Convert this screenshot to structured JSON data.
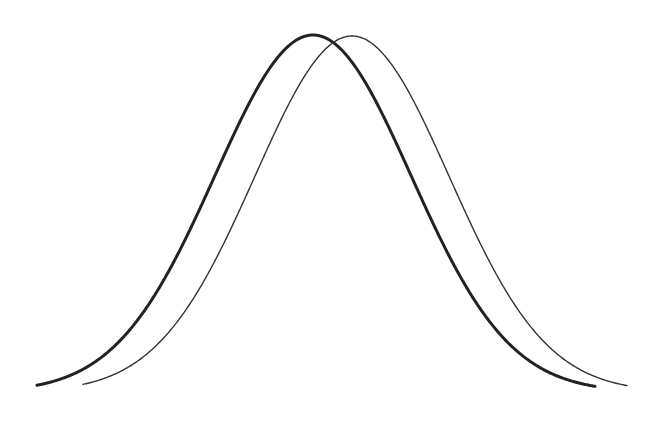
{
  "chart_data": {
    "type": "line",
    "title": "",
    "xlabel": "",
    "ylabel": "",
    "grid": false,
    "legend": null,
    "axes_visible": false,
    "series": [
      {
        "name": "Distribution A (thick)",
        "shape": "normal",
        "mean_px": 313,
        "sigma_px": 98,
        "x_start_px": 37,
        "x_end_px": 595,
        "peak_y_px": 35,
        "baseline_y_px": 392,
        "stroke": "#222222",
        "stroke_width": 3
      },
      {
        "name": "Distribution B (thin)",
        "shape": "normal",
        "mean_px": 352,
        "sigma_px": 97,
        "x_start_px": 83,
        "x_end_px": 627,
        "peak_y_px": 36,
        "baseline_y_px": 392,
        "stroke": "#333333",
        "stroke_width": 1.4
      }
    ]
  }
}
